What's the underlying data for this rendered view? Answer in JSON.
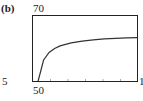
{
  "panel_label": "(b)",
  "window_labels": {
    "top": "70",
    "left": "5",
    "right": "1",
    "bottom": "50"
  },
  "chart_data": {
    "type": "line",
    "title": "",
    "xlabel": "",
    "ylabel": "",
    "xlim": [
      5,
      100
    ],
    "ylim": [
      50,
      70
    ],
    "grid": false,
    "legend": null,
    "x_tick_marks": 5,
    "series": [
      {
        "name": "curve",
        "x": [
          10,
          15,
          20,
          25,
          30,
          40,
          50,
          60,
          70,
          80,
          90,
          100
        ],
        "y": [
          50,
          56.5,
          58.8,
          60.0,
          60.8,
          61.7,
          62.2,
          62.6,
          62.9,
          63.1,
          63.2,
          63.3
        ]
      }
    ],
    "annotations": [
      "Window corner labels: 70 (top), 5 (left), 1 (right, clipped), 50 (bottom)"
    ]
  }
}
